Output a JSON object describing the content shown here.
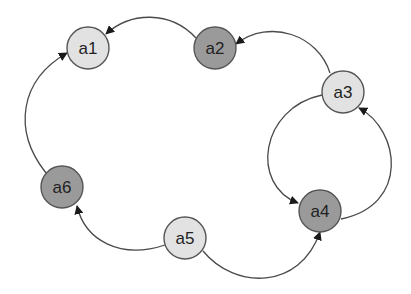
{
  "diagram": {
    "type": "directed-graph",
    "colors": {
      "light_node": "#e2e2e2",
      "dark_node": "#9a9a9a",
      "stroke": "#555555",
      "edge": "#4a4a4a",
      "arrow": "#1a1a1a",
      "text": "#222222"
    },
    "nodes": [
      {
        "id": "a1",
        "label": "a1",
        "shade": "light",
        "cx": 88,
        "cy": 48
      },
      {
        "id": "a2",
        "label": "a2",
        "shade": "dark",
        "cx": 215,
        "cy": 48
      },
      {
        "id": "a3",
        "label": "a3",
        "shade": "light",
        "cx": 343,
        "cy": 92
      },
      {
        "id": "a4",
        "label": "a4",
        "shade": "dark",
        "cx": 320,
        "cy": 211
      },
      {
        "id": "a5",
        "label": "a5",
        "shade": "light",
        "cx": 185,
        "cy": 238
      },
      {
        "id": "a6",
        "label": "a6",
        "shade": "dark",
        "cx": 62,
        "cy": 187
      }
    ],
    "edges": [
      {
        "from": "a2",
        "to": "a1"
      },
      {
        "from": "a3",
        "to": "a2"
      },
      {
        "from": "a3",
        "to": "a4"
      },
      {
        "from": "a4",
        "to": "a3"
      },
      {
        "from": "a5",
        "to": "a4"
      },
      {
        "from": "a5",
        "to": "a6"
      },
      {
        "from": "a6",
        "to": "a1"
      }
    ]
  }
}
